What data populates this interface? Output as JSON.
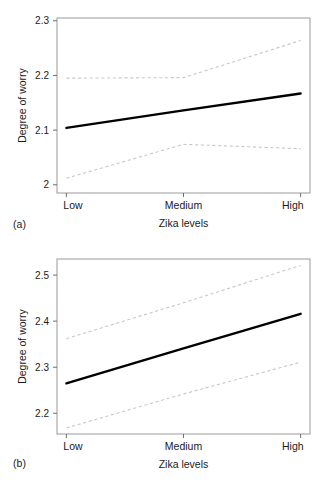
{
  "figure": {
    "panels": [
      {
        "tag": "(a)",
        "xlabel": "Zika levels",
        "ylabel": "Degree of worry",
        "categories": [
          "Low",
          "Medium",
          "High"
        ],
        "yticks": [
          "2",
          "2.1",
          "2.2",
          "2.3"
        ]
      },
      {
        "tag": "(b)",
        "xlabel": "Zika levels",
        "ylabel": "Degree of worry",
        "categories": [
          "Low",
          "Medium",
          "High"
        ],
        "yticks": [
          "2.2",
          "2.3",
          "2.4",
          "2.5"
        ]
      }
    ]
  },
  "chart_data": [
    {
      "type": "line",
      "panel": "(a)",
      "title": "",
      "xlabel": "Zika levels",
      "ylabel": "Degree of worry",
      "categories": [
        "Low",
        "Medium",
        "High"
      ],
      "x": [
        0,
        1,
        2
      ],
      "xtick_labels": [
        "Low",
        "Medium",
        "High"
      ],
      "ytick_values": [
        2,
        2.1,
        2.2,
        2.3
      ],
      "ytick_labels": [
        "2",
        "2.1",
        "2.2",
        "2.3"
      ],
      "ylim": [
        1.985,
        2.305
      ],
      "xlim": [
        -0.08,
        2.08
      ],
      "grid": false,
      "legend": "none",
      "series": [
        {
          "name": "Predicted degree of worry",
          "style": "solid",
          "color": "#000000",
          "values": [
            2.104,
            2.136,
            2.167
          ]
        },
        {
          "name": "Upper 95% confidence limit",
          "style": "dashed",
          "color": "#c9c9c9",
          "values": [
            2.195,
            2.196,
            2.264
          ]
        },
        {
          "name": "Lower 95% confidence limit",
          "style": "dashed",
          "color": "#c9c9c9",
          "values": [
            2.012,
            2.074,
            2.066
          ]
        }
      ]
    },
    {
      "type": "line",
      "panel": "(b)",
      "title": "",
      "xlabel": "Zika levels",
      "ylabel": "Degree of worry",
      "categories": [
        "Low",
        "Medium",
        "High"
      ],
      "x": [
        0,
        1,
        2
      ],
      "xtick_labels": [
        "Low",
        "Medium",
        "High"
      ],
      "ytick_values": [
        2.2,
        2.3,
        2.4,
        2.5
      ],
      "ytick_labels": [
        "2.2",
        "2.3",
        "2.4",
        "2.5"
      ],
      "ylim": [
        2.155,
        2.535
      ],
      "xlim": [
        -0.08,
        2.08
      ],
      "grid": false,
      "legend": "none",
      "series": [
        {
          "name": "Predicted degree of worry",
          "style": "solid",
          "color": "#000000",
          "values": [
            2.265,
            2.341,
            2.416
          ]
        },
        {
          "name": "Upper 95% confidence limit",
          "style": "dashed",
          "color": "#c9c9c9",
          "values": [
            2.362,
            2.44,
            2.521
          ]
        },
        {
          "name": "Lower 95% confidence limit",
          "style": "dashed",
          "color": "#c9c9c9",
          "values": [
            2.168,
            2.242,
            2.311
          ]
        }
      ]
    }
  ]
}
